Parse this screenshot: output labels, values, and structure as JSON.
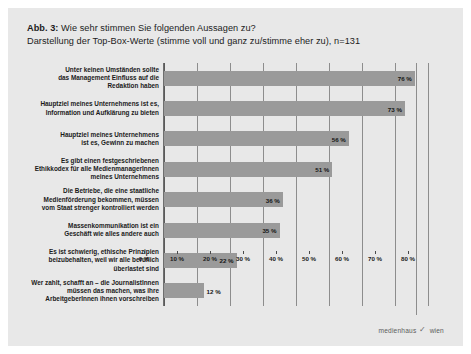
{
  "figure": {
    "label_prefix": "Abb. 3:",
    "title_line1": "Wie sehr stimmen Sie folgenden Aussagen zu?",
    "title_line2": "Darstellung der Top-Box-Werte (stimme voll und ganz zu/stimme eher zu), n=131"
  },
  "footer": {
    "brand": "medienhaus",
    "check_icon": "✓",
    "city": "wien"
  },
  "chart_data": {
    "type": "bar",
    "orientation": "horizontal",
    "title": "Wie sehr stimmen Sie folgenden Aussagen zu?",
    "subtitle": "Darstellung der Top-Box-Werte (stimme voll und ganz zu/stimme eher zu), n=131",
    "xlabel": "",
    "ylabel": "",
    "xlim": [
      0,
      80
    ],
    "grid": true,
    "legend": "none",
    "bar_color": "#9a9a9a",
    "background_color": "#e8e8e8",
    "xticks": [
      0,
      10,
      20,
      30,
      40,
      50,
      60,
      70,
      80
    ],
    "xtick_labels": [
      "0 %",
      "10 %",
      "20 %",
      "30 %",
      "40 %",
      "50 %",
      "60 %",
      "70 %",
      "80 %"
    ],
    "categories": [
      "Unter keinen Umständen sollte\ndas Management Einfluss auf die\nRedaktion haben",
      "Hauptziel meines Unternehmens ist es,\nInformation und Aufklärung zu bieten",
      "Hauptziel meines Unternehmens\nist es, Gewinn zu machen",
      "Es gibt einen festgeschriebenen\nEthikkodex für alle MedienmanagerInnen\nmeines Unternehmens",
      "Die Betriebe, die eine staatliche\nMedienförderung bekommen, müssen\nvom Staat strenger kontrolliert werden",
      "Massenkommunikation ist ein\nGeschäft wie alles andere auch",
      "Es ist schwierig, ethische Prinzipien\nbeizubehalten, weil wir alle beruflich\nüberlastet sind",
      "Wer zahlt, schafft an – die JournalistInnen\nmüssen das machen, was ihre\nArbeitgeberInnen ihnen vorschreiben"
    ],
    "values": [
      76,
      73,
      56,
      51,
      36,
      35,
      22,
      12
    ],
    "value_labels": [
      "76 %",
      "73 %",
      "56 %",
      "51 %",
      "36 %",
      "35 %",
      "22 %",
      "12 %"
    ]
  },
  "bars": [
    {
      "lines": [
        "Unter keinen Umständen sollte",
        "das Management Einfluss auf die",
        "Redaktion haben"
      ],
      "value": 76,
      "value_label": "76 %"
    },
    {
      "lines": [
        "Hauptziel meines Unternehmens ist es,",
        "Information und Aufklärung zu bieten"
      ],
      "value": 73,
      "value_label": "73 %"
    },
    {
      "lines": [
        "Hauptziel meines Unternehmens",
        "ist es, Gewinn zu machen"
      ],
      "value": 56,
      "value_label": "56 %"
    },
    {
      "lines": [
        "Es gibt einen festgeschriebenen",
        "Ethikkodex für alle MedienmanagerInnen",
        "meines Unternehmens"
      ],
      "value": 51,
      "value_label": "51 %"
    },
    {
      "lines": [
        "Die Betriebe, die eine staatliche",
        "Medienförderung bekommen, müssen",
        "vom Staat strenger kontrolliert werden"
      ],
      "value": 36,
      "value_label": "36 %"
    },
    {
      "lines": [
        "Massenkommunikation ist ein",
        "Geschäft wie alles andere auch"
      ],
      "value": 35,
      "value_label": "35 %"
    },
    {
      "lines": [
        "Es ist schwierig, ethische Prinzipien",
        "beizubehalten, weil wir alle beruflich",
        "überlastet sind"
      ],
      "value": 22,
      "value_label": "22 %"
    },
    {
      "lines": [
        "Wer zahlt, schafft an – die JournalistInnen",
        "müssen das machen, was ihre",
        "ArbeitgeberInnen ihnen vorschreiben"
      ],
      "value": 12,
      "value_label": "12 %"
    }
  ]
}
